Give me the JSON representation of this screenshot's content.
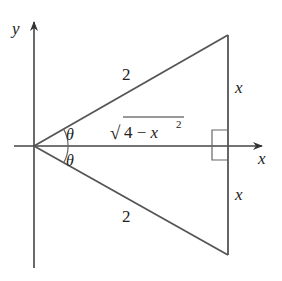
{
  "diagram": {
    "type": "geometry",
    "colors": {
      "line": "#555555",
      "text": "#222222",
      "background": "#ffffff"
    },
    "axes": {
      "x_label": "x",
      "y_label": "y"
    },
    "triangle": {
      "upper_hypotenuse_label": "2",
      "lower_hypotenuse_label": "2",
      "upper_leg_label": "x",
      "lower_leg_label": "x",
      "adjacent_label_radical": "√",
      "adjacent_label_body": "4 − x",
      "adjacent_label_exponent": "2",
      "upper_angle_label": "θ",
      "lower_angle_label": "θ",
      "right_angle_marker": true
    }
  }
}
